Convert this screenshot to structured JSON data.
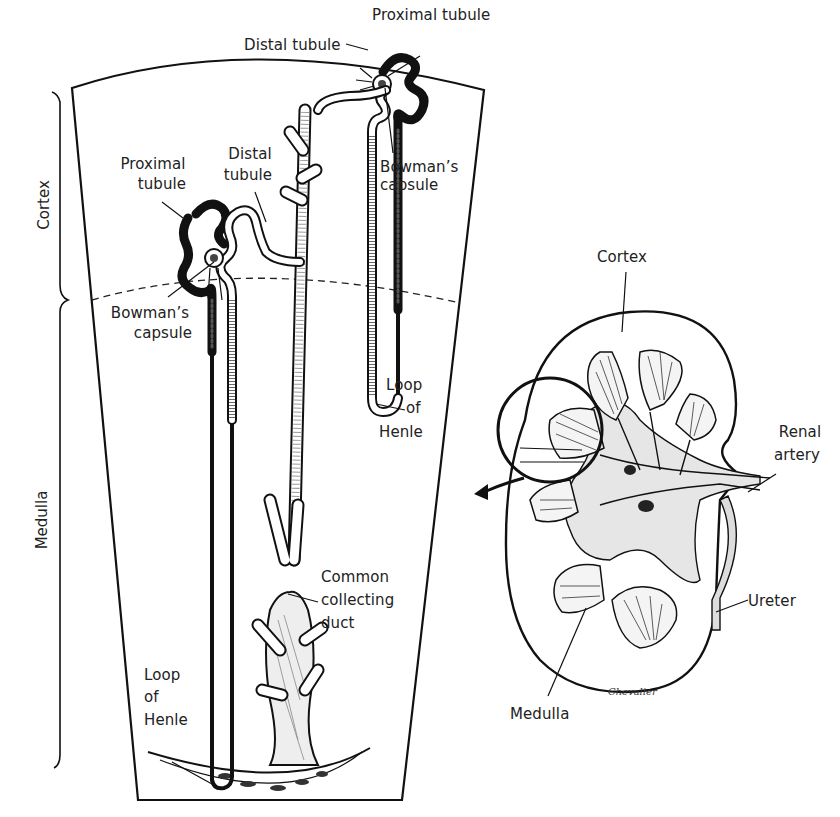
{
  "figure": {
    "type": "anatomical-illustration",
    "colors": {
      "ink": "#111111",
      "background": "#ffffff",
      "label": "#222222"
    }
  },
  "nephron_panel": {
    "region_labels": {
      "cortex": "Cortex",
      "medulla": "Medulla"
    },
    "labels": {
      "proximal_tubule_top": "Proximal tubule",
      "distal_tubule_top": "Distal tubule",
      "bowmans_capsule_top_line1": "Bowman’s",
      "bowmans_capsule_top_line2": "capsule",
      "proximal_tubule_left_line1": "Proximal",
      "proximal_tubule_left_line2": "tubule",
      "distal_tubule_left_line1": "Distal",
      "distal_tubule_left_line2": "tubule",
      "bowmans_capsule_left_line1": "Bowman’s",
      "bowmans_capsule_left_line2": "capsule",
      "loop_of_henle_right_line1": "Loop",
      "loop_of_henle_right_line2": "of",
      "loop_of_henle_right_line3": "Henle",
      "loop_of_henle_left_line1": "Loop",
      "loop_of_henle_left_line2": "of",
      "loop_of_henle_left_line3": "Henle",
      "collecting_duct_line1": "Common",
      "collecting_duct_line2": "collecting",
      "collecting_duct_line3": "duct"
    }
  },
  "kidney_panel": {
    "labels": {
      "cortex": "Cortex",
      "renal_artery_line1": "Renal",
      "renal_artery_line2": "artery",
      "ureter": "Ureter",
      "medulla": "Medulla"
    },
    "signature": "Chevalier"
  }
}
